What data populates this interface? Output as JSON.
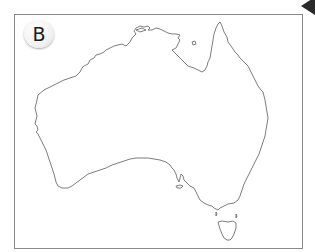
{
  "figure": {
    "label": "B",
    "colors": {
      "frame": "#8a8a8a",
      "coastline": "#6e6e6e",
      "background": "#ffffff",
      "badge_text": "#1a1a1a"
    }
  }
}
